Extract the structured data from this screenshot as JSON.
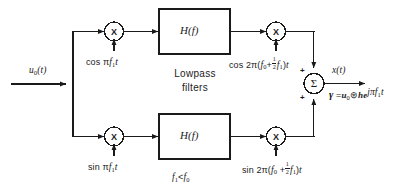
{
  "diagram": {
    "input_label": "u",
    "input_sub": "0",
    "input_arg": "(t)",
    "output_label": "x",
    "output_arg": "(t)",
    "filter_block_label": "H(f)",
    "filter_group_label_line1": "Lowpass",
    "filter_group_label_line2": "filters",
    "condition": "f1 < f0",
    "multiplier_symbol": "X",
    "summer_symbol": "Σ",
    "sum_sign_top": "+",
    "sum_sign_bottom": "+",
    "carriers": {
      "top_baseband": "cos πf1t",
      "bottom_baseband": "sin πf1t",
      "top_rf": "cos 2π(f0 + ½f1)t",
      "bottom_rf": "sin 2π(f0 + ½f1)t"
    },
    "output_equation": "γ = u0 ⊛ h e^(jπf1t)",
    "colors": {
      "line": "#1a1a1a",
      "text": "#1a1a1a",
      "background": "#ffffff"
    }
  }
}
